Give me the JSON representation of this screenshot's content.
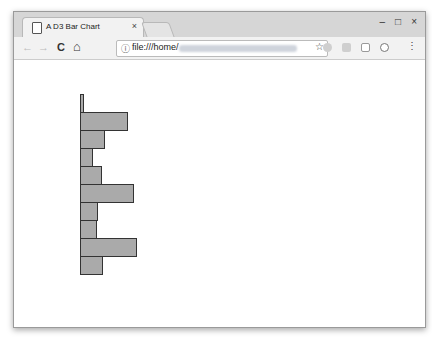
{
  "browser": {
    "tab_title": "A D3 Bar Chart",
    "tab_close": "×",
    "url_prefix": "file:///home/",
    "info_icon": "ⓘ",
    "star_icon": "☆",
    "back_icon": "←",
    "forward_icon": "→",
    "reload_icon": "C",
    "home_icon": "⌂",
    "minimize_icon": "–",
    "maximize_icon": "□",
    "close_icon": "×",
    "menu_icon": "⋮"
  },
  "chart_data": {
    "type": "bar",
    "orientation": "horizontal",
    "title": "",
    "xlabel": "",
    "ylabel": "",
    "categories": [
      "1",
      "2",
      "3",
      "4",
      "5",
      "6",
      "7",
      "8",
      "9",
      "10"
    ],
    "values": [
      4,
      48,
      25,
      13,
      22,
      54,
      18,
      17,
      57,
      23
    ],
    "bar_color": "#aaaaaa",
    "stroke_color": "#333333",
    "axes": "none",
    "grid": false,
    "legend": "none"
  }
}
